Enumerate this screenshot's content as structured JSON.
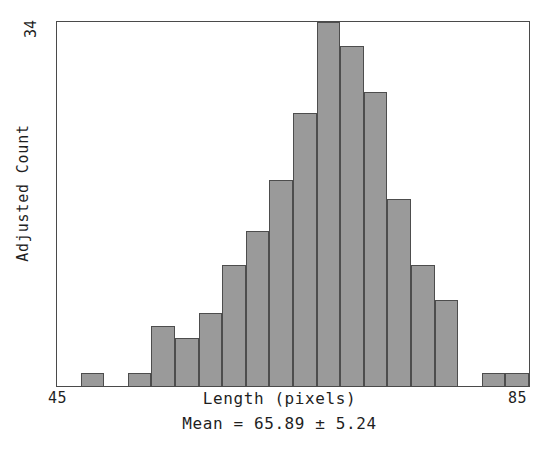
{
  "chart_data": {
    "type": "bar",
    "title": "",
    "subtitle": "",
    "xlabel": "Length (pixels)",
    "ylabel": "Adjusted Count",
    "xlim": [
      45,
      85
    ],
    "ylim": [
      0,
      34
    ],
    "grid": false,
    "legend": null,
    "bin_width": 2,
    "x_tick_labels": [
      "45",
      "85"
    ],
    "y_tick_labels": [
      "34"
    ],
    "annotation": "Mean = 65.89 ± 5.24",
    "mean": 65.89,
    "std": 5.24,
    "bar_color": "#9a9a9a",
    "bar_edge_color": "#4d4d4d",
    "axis_color": "#4a4a4a",
    "background": "#ffffff",
    "bin_edges": [
      45,
      47,
      49,
      51,
      53,
      55,
      57,
      59,
      61,
      63,
      65,
      67,
      69,
      71,
      73,
      75,
      77,
      79,
      81,
      83,
      85
    ],
    "categories": [
      "45-47",
      "47-49",
      "49-51",
      "51-53",
      "53-55",
      "55-57",
      "57-59",
      "59-61",
      "61-63",
      "63-65",
      "65-67",
      "67-69",
      "69-71",
      "71-73",
      "73-75",
      "75-77",
      "77-79",
      "79-81",
      "81-83",
      "83-85"
    ],
    "values": [
      0,
      1.2,
      0,
      1.2,
      5.6,
      4.5,
      6.8,
      11.3,
      14.5,
      19.2,
      25.5,
      34,
      31.8,
      27.5,
      17.5,
      11.3,
      8,
      0,
      1.2,
      1.2
    ]
  }
}
